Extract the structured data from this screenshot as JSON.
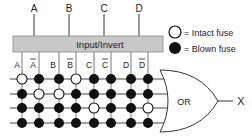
{
  "diagram": {
    "inputs": [
      "A",
      "B",
      "C",
      "D"
    ],
    "box_label": "Input/Invert",
    "columns": [
      {
        "name": "A",
        "inverted": false
      },
      {
        "name": "A",
        "inverted": true
      },
      {
        "name": "B",
        "inverted": false
      },
      {
        "name": "B",
        "inverted": true
      },
      {
        "name": "C",
        "inverted": false
      },
      {
        "name": "C",
        "inverted": true
      },
      {
        "name": "D",
        "inverted": false
      },
      {
        "name": "D",
        "inverted": true
      }
    ],
    "fuse_rows": [
      [
        "intact",
        "blown",
        "blown",
        "intact",
        "blown",
        "blown",
        "blown",
        "blown"
      ],
      [
        "blown",
        "intact",
        "intact",
        "blown",
        "blown",
        "blown",
        "blown",
        "blown"
      ],
      [
        "blown",
        "blown",
        "blown",
        "blown",
        "intact",
        "blown",
        "blown",
        "intact"
      ],
      [
        "blown",
        "blown",
        "blown",
        "blown",
        "blown",
        "blown",
        "blown",
        "blown"
      ]
    ],
    "gate_label": "OR",
    "output_label": "X",
    "legend": [
      {
        "symbol": "intact",
        "text": "= Intact fuse"
      },
      {
        "symbol": "blown",
        "text": "= Blown fuse"
      }
    ]
  }
}
